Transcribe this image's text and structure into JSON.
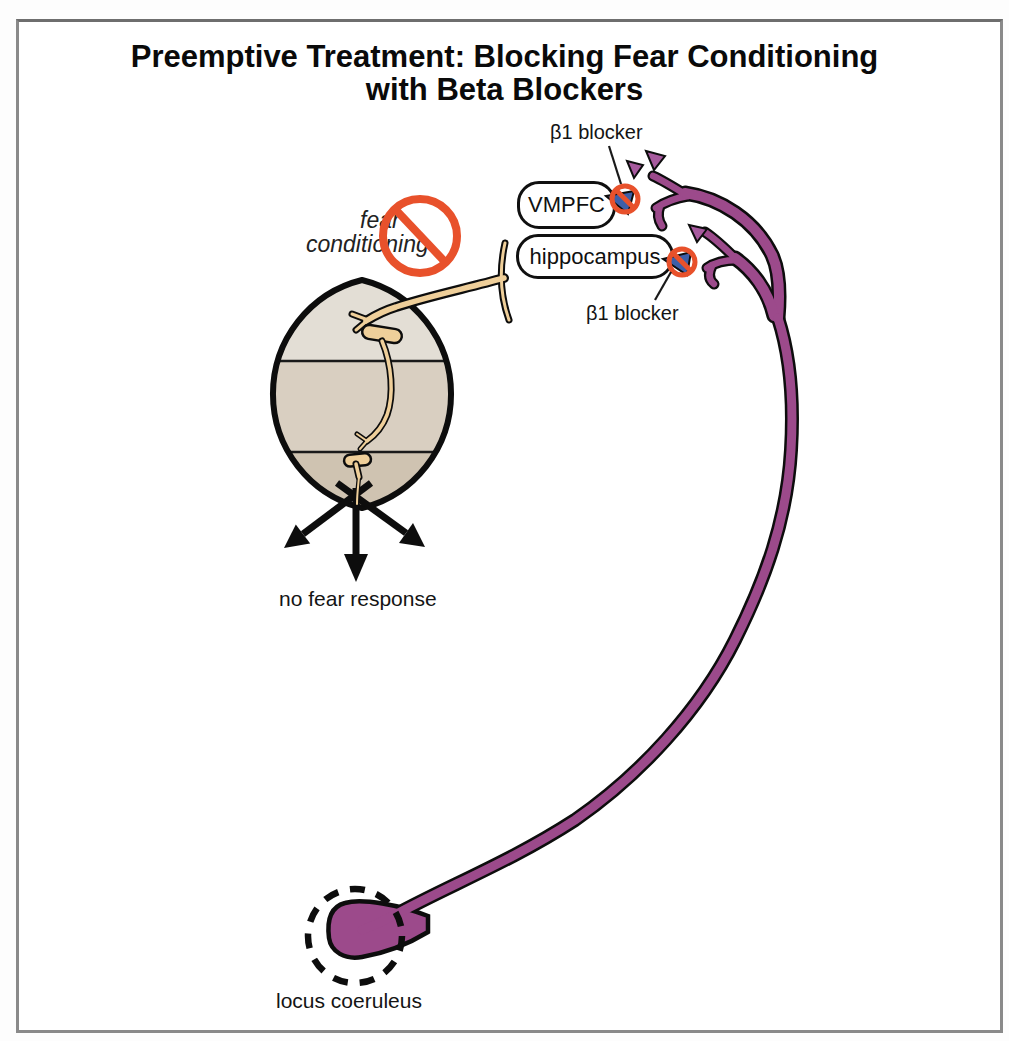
{
  "title": {
    "line1": "Preemptive Treatment: Blocking Fear Conditioning",
    "line2": "with Beta Blockers"
  },
  "labels": {
    "beta_blocker_top": "β1 blocker",
    "beta_blocker_bottom": "β1 blocker",
    "vmpfc": "VMPFC",
    "hippocampus": "hippocampus",
    "fear_line1": "fear",
    "fear_line2": "conditioning",
    "no_fear_response": "no fear response",
    "locus_coeruleus": "locus coeruleus"
  },
  "icons": {
    "prohibition_icon": "red circle with diagonal slash (no symbol)",
    "ne_triangle_icon": "purple triangle (norepinephrine)",
    "beta1_receptor_icon": "blue receptor wedge",
    "dashed_circle_icon": "dashed highlight circle"
  },
  "colors": {
    "ne_purple": "#9c4a8b",
    "triangle_purple": "#a75a9e",
    "prohibition_red": "#e8512b",
    "receptor_blue": "#3d5fa8",
    "axon_tan": "#efcf9a",
    "amygdala_top_band": "#e3ded5",
    "amygdala_mid_band": "#d9cfc1",
    "amygdala_bottom_band": "#cfc3b1",
    "outline_black": "#0d0d0d",
    "frame_gray": "#8a8a8a"
  }
}
